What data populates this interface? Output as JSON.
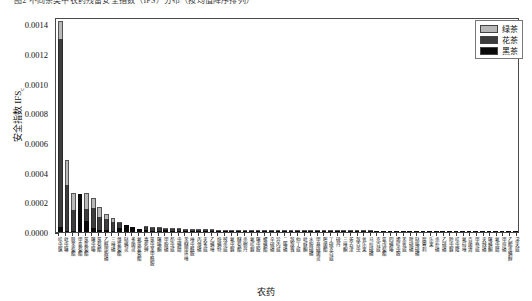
{
  "caption": "图2 不同茶类中农药残留安全指数（IFS）分布（按均值降序排列）",
  "legend": {
    "position": "top-right",
    "entries": [
      {
        "label": "绿茶",
        "color": "#b8b8b8",
        "name": "green-tea"
      },
      {
        "label": "花茶",
        "color": "#3d3d3d",
        "name": "flower-tea"
      },
      {
        "label": "黑茶",
        "color": "#0a0a0a",
        "name": "dark-tea"
      }
    ]
  },
  "chart_data": {
    "type": "bar",
    "stacked": true,
    "title": "",
    "xlabel": "农药",
    "ylabel": "安全指数 IFS",
    "ylabel_sub": "c",
    "ylim": [
      0.0,
      0.00145
    ],
    "yticks": [
      0.0,
      0.0002,
      0.0004,
      0.0006,
      0.0008,
      0.001,
      0.0012,
      0.0014
    ],
    "ytick_labels": [
      "0.0000",
      "0.0002",
      "0.0004",
      "0.0006",
      "0.0008",
      "0.0010",
      "0.0012",
      "0.0014"
    ],
    "grid": false,
    "legend_position": "upper right",
    "categories": [
      "啶虫脒",
      "吡虫啉",
      "联苯菊酯",
      "甲氰菊酯",
      "氯氰菊酯",
      "噻虫嗪",
      "氯菊酯",
      "乙酰甲胺磷",
      "三唑磷",
      "溴氰菊酯",
      "哒螨灵",
      "多菌灵",
      "氟氯氰菊酯",
      "毒死蜱",
      "氯虫苯甲酰胺",
      "噻嗪酮",
      "甲胺磷",
      "茚虫威",
      "虫螨腈",
      "苯醚甲环唑",
      "唑虫酰胺",
      "丙溴磷",
      "灭多威",
      "乙螨唑",
      "炔螨特",
      "残杀威",
      "氟虫脲",
      "醚菊酯",
      "杀螟丹",
      "氟啶脲",
      "噻虫胺",
      "螺螨酯",
      "辛硫磷",
      "异丙威",
      "二嗪磷",
      "敌敌畏",
      "仲丁威",
      "吡蚜酮",
      "水胺硫磷",
      "甲基硫菌灵",
      "嘧菌酯",
      "丁硫克百威",
      "硫丹",
      "三唑酮",
      "莠去津",
      "敌百虫",
      "氧乐果",
      "马拉硫磷",
      "克百威",
      "氰戊菊酯",
      "四螨嗪",
      "烯啶虫胺",
      "苯氧威",
      "喹硫磷",
      "哒嗪硫磷",
      "腐霉利",
      "乐果",
      "杀扑磷",
      "乙硫磷",
      "除虫脲",
      "啶虫隆",
      "氟硅唑",
      "百菌清",
      "甲萘威",
      "灭线磷",
      "噻螨酮",
      "氟虫腈",
      "甲拌磷",
      "乙酯杀螨醇",
      "涕灭威"
    ],
    "series": [
      {
        "name": "黑茶",
        "color": "#0a0a0a",
        "values": [
          3.5e-05,
          1e-05,
          8e-06,
          0.000255,
          7.5e-05,
          3e-05,
          1.5e-05,
          1.2e-05,
          8e-06,
          2.8e-05,
          5e-05,
          3.5e-05,
          2e-05,
          1.2e-05,
          6e-06,
          1e-05,
          1.2e-05,
          8e-06,
          6e-06,
          6e-06,
          5e-06,
          5e-06,
          5e-06,
          4e-06,
          4e-06,
          4e-06,
          3e-06,
          3e-06,
          3e-06,
          3e-06,
          3e-06,
          2e-06,
          2e-06,
          2e-06,
          2e-06,
          2e-06,
          2e-06,
          2e-06,
          2e-06,
          2e-06,
          1e-06,
          1e-06,
          1e-06,
          1e-06,
          1e-06,
          1e-06,
          1e-06,
          1e-06,
          1e-06,
          1e-06,
          1e-06,
          1e-06,
          1e-06,
          1e-06,
          1e-06,
          1e-06,
          1e-06,
          1e-06,
          1e-06,
          1e-06,
          1e-06,
          1e-06,
          1e-06,
          1e-06,
          1e-06,
          1e-06,
          1e-06,
          1e-06,
          1e-06,
          1e-06
        ]
      },
      {
        "name": "花茶",
        "color": "#3d3d3d",
        "values": [
          0.00127,
          0.000305,
          0.00014,
          0.0,
          8e-05,
          0.00013,
          8.5e-05,
          7.5e-05,
          6e-05,
          3.2e-05,
          0.0,
          0.0,
          0.0,
          2e-05,
          2.4e-05,
          1.4e-05,
          1e-05,
          1.2e-05,
          1.2e-05,
          1e-05,
          9e-06,
          8e-06,
          7e-06,
          7e-06,
          6e-06,
          6e-06,
          6e-06,
          5e-06,
          5e-06,
          5e-06,
          4e-06,
          4e-06,
          4e-06,
          4e-06,
          3e-06,
          3e-06,
          3e-06,
          3e-06,
          3e-06,
          2e-06,
          2e-06,
          2e-06,
          2e-06,
          2e-06,
          2e-06,
          2e-06,
          2e-06,
          2e-06,
          1e-06,
          1e-06,
          1e-06,
          1e-06,
          1e-06,
          1e-06,
          1e-06,
          1e-06,
          1e-06,
          1e-06,
          1e-06,
          1e-06,
          1e-06,
          1e-06,
          1e-06,
          1e-06,
          1e-06,
          1e-06,
          1e-06,
          1e-06,
          1e-06,
          0.0
        ]
      },
      {
        "name": "绿茶",
        "color": "#b8b8b8",
        "values": [
          0.000115,
          0.00017,
          0.000115,
          0.0,
          0.000105,
          7e-05,
          7e-05,
          3.5e-05,
          3e-05,
          1e-05,
          0.0,
          0.0,
          0.0,
          6e-06,
          5e-06,
          4e-06,
          3e-06,
          3e-06,
          2e-06,
          2e-06,
          2e-06,
          2e-06,
          2e-06,
          2e-06,
          2e-06,
          1e-06,
          1e-06,
          1e-06,
          1e-06,
          1e-06,
          1e-06,
          1e-06,
          1e-06,
          1e-06,
          1e-06,
          1e-06,
          1e-06,
          1e-06,
          1e-06,
          1e-06,
          1e-06,
          1e-06,
          1e-06,
          1e-06,
          1e-06,
          1e-06,
          1e-06,
          1e-06,
          0.0,
          0.0,
          0.0,
          0.0,
          0.0,
          0.0,
          0.0,
          0.0,
          0.0,
          0.0,
          0.0,
          0.0,
          0.0,
          0.0,
          0.0,
          0.0,
          0.0,
          0.0,
          0.0,
          0.0,
          0.0,
          0.0
        ]
      }
    ]
  }
}
